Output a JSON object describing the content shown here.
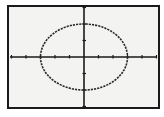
{
  "chart_data": {
    "type": "line",
    "title": "",
    "equation": "x^2/9 + y^2/4 = 1",
    "shape": "ellipse",
    "center": [
      0,
      0
    ],
    "semi_axis_x": 3,
    "semi_axis_y": 2,
    "xlabel": "",
    "ylabel": "",
    "xlim": [
      -5,
      5
    ],
    "ylim": [
      -3,
      3
    ],
    "xscl": 1,
    "yscl": 1,
    "grid": false,
    "style": "dotted",
    "colors": {
      "curve": "#2a2a2a",
      "axes": "#1a1a1a",
      "background": "#f3f3f1"
    }
  }
}
